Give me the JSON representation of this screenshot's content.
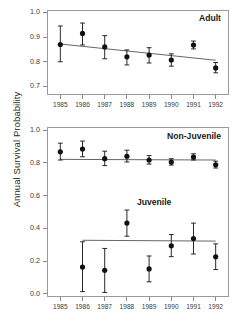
{
  "figure": {
    "ylabel": "Annual Survival Probability",
    "background": "#ffffff",
    "point_color": "#111111",
    "line_color": "#555555",
    "axis_color": "#9a9a9a"
  },
  "chart_data": [
    {
      "type": "scatter",
      "title": "Adult",
      "panel": "top",
      "xlabel": "",
      "ylabel": "Annual Survival Probability",
      "x": [
        1985,
        1986,
        1987,
        1988,
        1989,
        1990,
        1991,
        1992
      ],
      "categories": [
        "1985",
        "1986",
        "1987",
        "1988",
        "1989",
        "1990",
        "1991",
        "1992"
      ],
      "values": [
        0.87,
        0.915,
        0.86,
        0.82,
        0.827,
        0.807,
        0.868,
        0.775
      ],
      "err_low": [
        0.8,
        0.868,
        0.812,
        0.787,
        0.795,
        0.782,
        0.852,
        0.755
      ],
      "err_high": [
        0.945,
        0.957,
        0.906,
        0.848,
        0.857,
        0.832,
        0.884,
        0.797
      ],
      "xlim": [
        1984.4,
        1992.6
      ],
      "ylim": [
        0.665,
        1.01
      ],
      "yticks": [
        0.7,
        0.8,
        0.9,
        1.0
      ],
      "ytick_labels": [
        "0.7",
        "0.8",
        "0.9",
        "1.0"
      ],
      "grid": false,
      "legend": "none",
      "trend_line": {
        "label": "fitted trend",
        "x_start": 1985,
        "x_end": 1992,
        "y_start": 0.872,
        "y_end": 0.806
      }
    },
    {
      "type": "scatter",
      "title": "Non-Juvenile",
      "panel": "bottom-upper",
      "xlabel": "",
      "ylabel": "Annual Survival Probability",
      "x": [
        1985,
        1986,
        1987,
        1988,
        1989,
        1990,
        1991,
        1992
      ],
      "categories": [
        "1985",
        "1986",
        "1987",
        "1988",
        "1989",
        "1990",
        "1991",
        "1992"
      ],
      "values": [
        0.868,
        0.885,
        0.826,
        0.841,
        0.818,
        0.806,
        0.836,
        0.789
      ],
      "err_low": [
        0.818,
        0.838,
        0.784,
        0.806,
        0.793,
        0.787,
        0.818,
        0.769
      ],
      "err_high": [
        0.921,
        0.934,
        0.872,
        0.878,
        0.845,
        0.826,
        0.856,
        0.811
      ],
      "xlim": [
        1984.4,
        1992.6
      ],
      "ylim": [
        -0.02,
        1.02
      ],
      "yticks": [
        0.0,
        0.2,
        0.4,
        0.6,
        0.8,
        1.0
      ],
      "ytick_labels": [
        "0.0",
        "0.2",
        "0.4",
        "0.6",
        "0.8",
        "1.0"
      ],
      "grid": false,
      "legend": "none",
      "trend_line": {
        "label": "constant fit",
        "x_start": 1985,
        "x_end": 1992,
        "y_start": 0.822,
        "y_end": 0.818
      }
    },
    {
      "type": "scatter",
      "title": "Juvenile",
      "panel": "bottom-lower",
      "xlabel": "",
      "ylabel": "Annual Survival Probability",
      "x": [
        1986,
        1987,
        1988,
        1989,
        1990,
        1991,
        1992
      ],
      "categories": [
        "1986",
        "1987",
        "1988",
        "1989",
        "1990",
        "1991",
        "1992"
      ],
      "values": [
        0.163,
        0.143,
        0.432,
        0.152,
        0.293,
        0.338,
        0.226
      ],
      "err_low": [
        0.013,
        0.008,
        0.352,
        0.073,
        0.227,
        0.243,
        0.148
      ],
      "err_high": [
        0.318,
        0.277,
        0.512,
        0.231,
        0.362,
        0.432,
        0.305
      ],
      "xlim": [
        1984.4,
        1992.6
      ],
      "ylim": [
        -0.02,
        1.02
      ],
      "yticks": [
        0.0,
        0.2,
        0.4,
        0.6,
        0.8,
        1.0
      ],
      "ytick_labels": [
        "0.0",
        "0.2",
        "0.4",
        "0.6",
        "0.8",
        "1.0"
      ],
      "grid": false,
      "legend": "none",
      "trend_line": {
        "label": "constant fit",
        "x_start": 1986,
        "x_end": 1992,
        "y_start": 0.327,
        "y_end": 0.322
      }
    }
  ]
}
